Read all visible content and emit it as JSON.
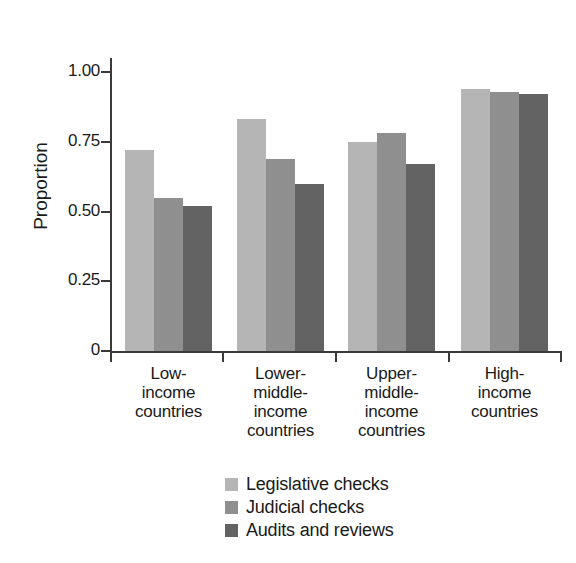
{
  "chart_data": {
    "type": "bar",
    "title": "",
    "subtitle": "",
    "xlabel": "",
    "ylabel": "Proportion",
    "ylim": [
      0,
      1.1
    ],
    "yticks": [
      0,
      0.25,
      0.5,
      0.75,
      1.0
    ],
    "ytick_labels": [
      "0",
      "0.25",
      "0.50",
      "0.75",
      "1.00"
    ],
    "grid": false,
    "legend_position": "bottom-center",
    "categories": [
      "Low-\nincome\ncountries",
      "Lower-\nmiddle-\nincome\ncountries",
      "Upper-\nmiddle-\nincome\ncountries",
      "High-\nincome\ncountries"
    ],
    "category_lines": [
      [
        "Low-",
        "income",
        "countries"
      ],
      [
        "Lower-",
        "middle-",
        "income",
        "countries"
      ],
      [
        "Upper-",
        "middle-",
        "income",
        "countries"
      ],
      [
        "High-",
        "income",
        "countries"
      ]
    ],
    "series": [
      {
        "name": "Legislative checks",
        "color": "#b5b5b5",
        "values": [
          0.72,
          0.83,
          0.75,
          0.94
        ]
      },
      {
        "name": "Judicial checks",
        "color": "#8f8f8f",
        "values": [
          0.55,
          0.69,
          0.78,
          0.93
        ]
      },
      {
        "name": "Audits and reviews",
        "color": "#636363",
        "values": [
          0.52,
          0.6,
          0.67,
          0.92
        ]
      }
    ]
  },
  "axis": {
    "y_title": "Proportion",
    "tick_labels": [
      "1.00",
      "0.75",
      "0.50",
      "0.25",
      "0"
    ]
  },
  "legend": {
    "items": [
      {
        "label": "Legislative checks",
        "color": "#b5b5b5"
      },
      {
        "label": "Judicial checks",
        "color": "#8f8f8f"
      },
      {
        "label": "Audits and reviews",
        "color": "#636363"
      }
    ]
  },
  "colors": {
    "axis": "#3a3a3a",
    "text": "#1a1a1a",
    "background": "#ffffff",
    "series_light": "#b5b5b5",
    "series_medium": "#8f8f8f",
    "series_dark": "#636363"
  }
}
